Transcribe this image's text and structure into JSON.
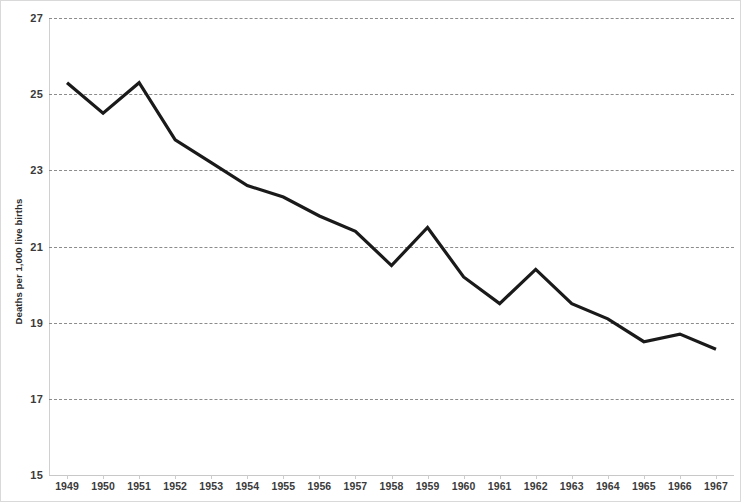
{
  "chart_data": {
    "type": "line",
    "title": "",
    "xlabel": "",
    "ylabel": "Deaths per 1,000 live births",
    "x": [
      1949,
      1950,
      1951,
      1952,
      1953,
      1954,
      1955,
      1956,
      1957,
      1958,
      1959,
      1960,
      1961,
      1962,
      1963,
      1964,
      1965,
      1966,
      1967
    ],
    "categories": [
      "1949",
      "1950",
      "1951",
      "1952",
      "1953",
      "1954",
      "1955",
      "1956",
      "1957",
      "1958",
      "1959",
      "1960",
      "1961",
      "1962",
      "1963",
      "1964",
      "1965",
      "1966",
      "1967"
    ],
    "values": [
      25.3,
      24.5,
      25.3,
      23.8,
      23.2,
      22.6,
      22.3,
      21.8,
      21.4,
      20.5,
      21.5,
      20.2,
      19.5,
      20.4,
      19.5,
      19.1,
      18.5,
      18.7,
      18.3
    ],
    "series": [
      {
        "name": "Infant mortality rate",
        "values": [
          25.3,
          24.5,
          25.3,
          23.8,
          23.2,
          22.6,
          22.3,
          21.8,
          21.4,
          20.5,
          21.5,
          20.2,
          19.5,
          20.4,
          19.5,
          19.1,
          18.5,
          18.7,
          18.3
        ],
        "color": "#1a1a1a",
        "line_width": 3.2
      }
    ],
    "ylim": [
      15,
      27
    ],
    "xlim": [
      1949,
      1967
    ],
    "yticks": [
      15,
      17,
      19,
      21,
      23,
      25,
      27
    ],
    "ytick_labels": [
      "15",
      "17",
      "19",
      "21",
      "23",
      "25",
      "27"
    ],
    "xtick_labels": [
      "1949",
      "1950",
      "1951",
      "1952",
      "1953",
      "1954",
      "1955",
      "1956",
      "1957",
      "1958",
      "1959",
      "1960",
      "1961",
      "1962",
      "1963",
      "1964",
      "1965",
      "1966",
      "1967"
    ],
    "grid": {
      "horizontal": true,
      "vertical": false,
      "style": "dashed",
      "color": "#8c8c8c",
      "values": [
        17,
        19,
        21,
        23,
        25,
        27
      ]
    },
    "legend": {
      "visible": false,
      "position": "none",
      "entries": []
    },
    "annotations": [],
    "colors": {
      "line": "#1a1a1a",
      "grid": "#8c8c8c",
      "axis": "#cccccc",
      "text": "#3a3a3a",
      "background": "#ffffff",
      "border": "#d9d9d9"
    }
  }
}
